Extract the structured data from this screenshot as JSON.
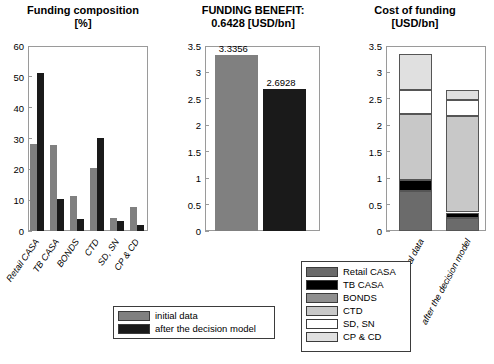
{
  "chart_data": [
    {
      "type": "bar",
      "title": "Funding composition",
      "subtitle": "[%]",
      "xlabel": "",
      "ylabel": "",
      "ylim": [
        0,
        60
      ],
      "yticks": [
        "0",
        "10",
        "20",
        "30",
        "40",
        "50",
        "60"
      ],
      "grid": false,
      "legend_position": "below-figure",
      "categories": [
        "Retail CASA",
        "TB CASA",
        "BONDS",
        "CTD",
        "SD, SN",
        "CP & CD"
      ],
      "series": [
        {
          "name": "initial data",
          "color": "#808080",
          "values": [
            28.2,
            27.8,
            11.4,
            20.4,
            4.2,
            7.8
          ]
        },
        {
          "name": "after the decision model",
          "color": "#1a1a1a",
          "values": [
            51.1,
            10.3,
            4.0,
            30.1,
            3.1,
            2.1
          ]
        }
      ]
    },
    {
      "type": "bar",
      "title": "FUNDING BENEFIT:",
      "subtitle": "0.6428 [USD/bn]",
      "xlabel": "",
      "ylabel": "",
      "ylim": [
        0,
        3.5
      ],
      "yticks": [
        "0",
        "0.5",
        "1",
        "1.5",
        "2",
        "2.5",
        "3",
        "3.5"
      ],
      "grid": false,
      "categories": [
        "initial data",
        "after the decision model"
      ],
      "values": [
        3.3356,
        2.6928
      ],
      "data_labels": [
        "3.3356",
        "2.6928"
      ],
      "colors": [
        "#808080",
        "#1a1a1a"
      ]
    },
    {
      "type": "bar",
      "title": "Cost of funding",
      "subtitle": "[USD/bn]",
      "xlabel": "",
      "ylabel": "",
      "ylim": [
        0,
        3.5
      ],
      "yticks": [
        "0",
        "0.5",
        "1",
        "1.5",
        "2",
        "2.5",
        "3",
        "3.5"
      ],
      "grid": false,
      "stacked": true,
      "legend_position": "bottom-left-of-axes",
      "categories": [
        "initial data",
        "after the decision model"
      ],
      "series": [
        {
          "name": "Retail CASA",
          "color": "#6b6b6b",
          "values": [
            0.76,
            0.25
          ]
        },
        {
          "name": "TB CASA",
          "color": "#000000",
          "values": [
            0.2,
            0.1
          ]
        },
        {
          "name": "BONDS",
          "color": "#8f8f8f",
          "values": [
            0.0,
            0.0
          ]
        },
        {
          "name": "CTD",
          "color": "#c8c8c8",
          "values": [
            1.26,
            1.82
          ]
        },
        {
          "name": "SD, SN",
          "color": "#ffffff",
          "values": [
            0.44,
            0.3
          ]
        },
        {
          "name": "CP & CD",
          "color": "#e0e0e0",
          "values": [
            0.68,
            0.2
          ]
        }
      ],
      "totals": [
        3.3356,
        2.6928
      ]
    }
  ],
  "series_legend": {
    "items": [
      {
        "label": "initial data",
        "color": "#808080"
      },
      {
        "label": "after the decision model",
        "color": "#1a1a1a"
      }
    ]
  },
  "category_legend": {
    "items": [
      {
        "label": "Retail CASA",
        "color": "#6b6b6b"
      },
      {
        "label": "TB CASA",
        "color": "#000000"
      },
      {
        "label": "BONDS",
        "color": "#8f8f8f"
      },
      {
        "label": "CTD",
        "color": "#c8c8c8"
      },
      {
        "label": "SD, SN",
        "color": "#ffffff"
      },
      {
        "label": "CP & CD",
        "color": "#e0e0e0"
      }
    ]
  }
}
